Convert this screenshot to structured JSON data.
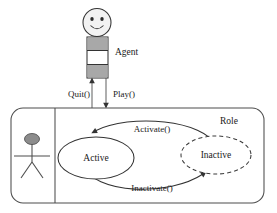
{
  "diagram": {
    "type": "uml-state-role-diagram",
    "background_color": "#ffffff",
    "line_color": "#4d4d4d",
    "text_color": "#1a1a1a",
    "accent_gray": "#a8a8a8"
  },
  "actor": {
    "name": "Agent",
    "icon": "smiley-face-actor",
    "body_segments": [
      "gray",
      "white",
      "gray"
    ]
  },
  "package": {
    "name": "Role",
    "icon": "stick-figure-actor",
    "shape": "rounded-rectangle"
  },
  "states": [
    {
      "id": "active",
      "label": "Active",
      "border": "solid",
      "fill": "#ffffff"
    },
    {
      "id": "inactive",
      "label": "Inactive",
      "border": "dashed",
      "fill": "#ffffff"
    }
  ],
  "transitions": [
    {
      "id": "activate",
      "label": "Activate()",
      "from": "inactive",
      "to": "active",
      "position": "upper-curve"
    },
    {
      "id": "inactivate",
      "label": "Inactivate()",
      "from": "active",
      "to": "inactive",
      "position": "lower-curve"
    }
  ],
  "ports": [
    {
      "id": "quit",
      "label": "Quit()",
      "direction": "up",
      "to": "agent"
    },
    {
      "id": "play",
      "label": "Play()",
      "direction": "down",
      "to": "role"
    }
  ]
}
